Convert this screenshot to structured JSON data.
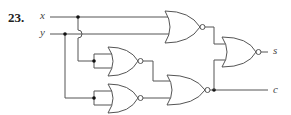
{
  "problem": {
    "number": "23."
  },
  "inputs": [
    {
      "label": "x"
    },
    {
      "label": "y"
    }
  ],
  "outputs": [
    {
      "label": "s"
    },
    {
      "label": "c"
    }
  ],
  "gates": [
    {
      "id": "nor-top",
      "type": "NOR",
      "inputs": [
        "x",
        "y"
      ]
    },
    {
      "id": "nor-mid-left",
      "type": "NOR",
      "inputs": [
        "x",
        "x"
      ]
    },
    {
      "id": "nor-bottom-left",
      "type": "NOR",
      "inputs": [
        "y",
        "y"
      ]
    },
    {
      "id": "nor-bottom-right",
      "type": "NOR",
      "inputs": [
        "nor-mid-left",
        "nor-bottom-left"
      ],
      "output": "c"
    },
    {
      "id": "nor-right",
      "type": "NOR",
      "inputs": [
        "nor-top",
        "nor-bottom-right"
      ],
      "output": "s"
    }
  ],
  "colors": {
    "wire": "#555555",
    "text": "#444444"
  }
}
